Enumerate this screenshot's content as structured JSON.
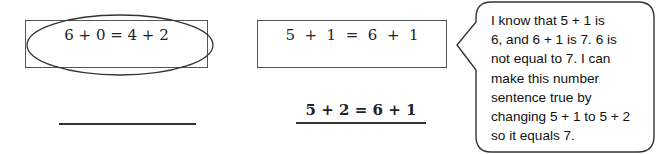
{
  "left_item": {
    "equation": "6 + 0 = 4 + 2",
    "circled": true,
    "answer_line": ""
  },
  "middle_item": {
    "equation": "5  +  1  =  6  +  1",
    "corrected_equation": "5 + 2 = 6 + 1"
  },
  "speech_bubble": {
    "lines": [
      "I know that 5 + 1 is",
      "6, and 6 + 1 is 7.  6 is",
      "not equal to 7.  I can",
      "make this number",
      "sentence true by",
      "changing 5 + 1 to 5 + 2",
      "so it equals 7."
    ]
  }
}
